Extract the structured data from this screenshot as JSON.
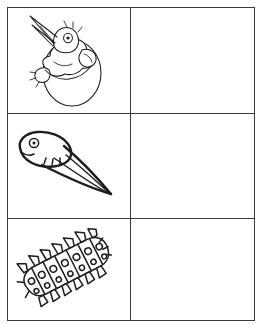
{
  "document": {
    "type": "worksheet",
    "title": "Baby Animals Matching Worksheet",
    "background_color": "#ffffff",
    "ink_color": "#1d1d1f",
    "border_color": "#3a3a3c"
  },
  "grid": {
    "columns": 2,
    "rows": 3,
    "column_headers": [
      "",
      ""
    ],
    "rows_data": [
      {
        "left": {
          "kind": "illustration",
          "icon": "hatching-chick-icon",
          "label": "Chick hatching from egg",
          "alt": "A baby bird with open beak emerging from a cracked egg"
        },
        "right": {
          "kind": "blank",
          "label": "",
          "alt": "Empty answer cell"
        }
      },
      {
        "left": {
          "kind": "illustration",
          "icon": "tadpole-icon",
          "label": "Tadpole",
          "alt": "A tadpole with a rounded head and long pointed tail"
        },
        "right": {
          "kind": "blank",
          "label": "",
          "alt": "Empty answer cell"
        }
      },
      {
        "left": {
          "kind": "illustration",
          "icon": "caterpillar-icon",
          "label": "Caterpillar",
          "alt": "A segmented spiky caterpillar angled across the cell"
        },
        "right": {
          "kind": "blank",
          "label": "",
          "alt": "Empty answer cell"
        }
      }
    ]
  }
}
